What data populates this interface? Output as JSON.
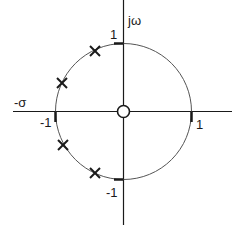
{
  "diagram": {
    "type": "s-plane pole-zero plot",
    "axes": {
      "vertical_label": "jω",
      "horizontal_label": "-σ"
    },
    "unit_circle": {
      "tick_labels": {
        "top": "1",
        "left": "-1",
        "right": "1",
        "bottom": "-1"
      }
    },
    "poles": [
      {
        "marker": "x",
        "position": "upper-left near top"
      },
      {
        "marker": "x",
        "position": "upper-left near real axis"
      },
      {
        "marker": "x",
        "position": "lower-left near real axis"
      },
      {
        "marker": "x",
        "position": "lower-left near bottom"
      }
    ],
    "zeros": [
      {
        "marker": "o",
        "position": "origin"
      }
    ],
    "colors": {
      "line": "#1a1a1a",
      "circle": "#555555",
      "background": "#ffffff"
    }
  }
}
